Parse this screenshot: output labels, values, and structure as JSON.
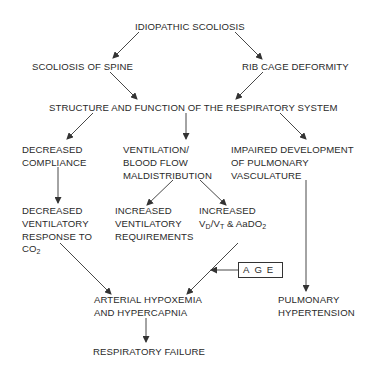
{
  "diagram": {
    "nodes": {
      "idiopathic": {
        "lines": [
          "IDIOPATHIC SCOLIOSIS"
        ]
      },
      "spine": {
        "lines": [
          "SCOLIOSIS OF SPINE"
        ]
      },
      "ribcage": {
        "lines": [
          "RIB CAGE DEFORMITY"
        ]
      },
      "structure": {
        "lines": [
          "STRUCTURE AND FUNCTION OF THE RESPIRATORY SYSTEM"
        ]
      },
      "compliance": {
        "lines": [
          "DECREASED",
          "COMPLIANCE"
        ]
      },
      "maldistribution": {
        "lines": [
          "VENTILATION/",
          "BLOOD FLOW",
          "MALDISTRIBUTION"
        ]
      },
      "vasculature": {
        "lines": [
          "IMPAIRED DEVELOPMENT",
          "OF PULMONARY",
          "VASCULATURE"
        ]
      },
      "vent_response": {
        "lines": [
          "DECREASED",
          "VENTILATORY",
          "RESPONSE TO",
          "CO",
          "2"
        ]
      },
      "vent_requirements": {
        "lines": [
          "INCREASED",
          "VENTILATORY",
          "REQUIREMENTS"
        ]
      },
      "vd_vt": {
        "lines": [
          "INCREASED",
          "V",
          "D",
          "/V",
          "T",
          " & AaDO",
          "2"
        ]
      },
      "age": {
        "label": "AGE"
      },
      "hypoxemia": {
        "lines": [
          "ARTERIAL HYPOXEMIA",
          "AND HYPERCAPNIA"
        ]
      },
      "pulm_htn": {
        "lines": [
          "PULMONARY",
          "HYPERTENSION"
        ]
      },
      "resp_failure": {
        "lines": [
          "RESPIRATORY FAILURE"
        ]
      }
    },
    "edges": [
      {
        "from": "IDIOPATHIC SCOLIOSIS",
        "to": "SCOLIOSIS OF SPINE"
      },
      {
        "from": "IDIOPATHIC SCOLIOSIS",
        "to": "RIB CAGE DEFORMITY"
      },
      {
        "from": "SCOLIOSIS OF SPINE",
        "to": "STRUCTURE AND FUNCTION OF THE RESPIRATORY SYSTEM"
      },
      {
        "from": "RIB CAGE DEFORMITY",
        "to": "STRUCTURE AND FUNCTION OF THE RESPIRATORY SYSTEM"
      },
      {
        "from": "STRUCTURE AND FUNCTION OF THE RESPIRATORY SYSTEM",
        "to": "DECREASED COMPLIANCE"
      },
      {
        "from": "STRUCTURE AND FUNCTION OF THE RESPIRATORY SYSTEM",
        "to": "VENTILATION/BLOOD FLOW MALDISTRIBUTION"
      },
      {
        "from": "STRUCTURE AND FUNCTION OF THE RESPIRATORY SYSTEM",
        "to": "IMPAIRED DEVELOPMENT OF PULMONARY VASCULATURE"
      },
      {
        "from": "DECREASED COMPLIANCE",
        "to": "DECREASED VENTILATORY RESPONSE TO CO2"
      },
      {
        "from": "VENTILATION/BLOOD FLOW MALDISTRIBUTION",
        "to": "INCREASED VENTILATORY REQUIREMENTS"
      },
      {
        "from": "VENTILATION/BLOOD FLOW MALDISTRIBUTION",
        "to": "INCREASED VD/VT & AaDO2"
      },
      {
        "from": "DECREASED VENTILATORY RESPONSE TO CO2",
        "to": "ARTERIAL HYPOXEMIA AND HYPERCAPNIA"
      },
      {
        "from": "INCREASED VD/VT & AaDO2",
        "to": "ARTERIAL HYPOXEMIA AND HYPERCAPNIA"
      },
      {
        "from": "AGE",
        "to": "INCREASED VD/VT & AaDO2 → ARTERIAL HYPOXEMIA edge"
      },
      {
        "from": "IMPAIRED DEVELOPMENT OF PULMONARY VASCULATURE",
        "to": "PULMONARY HYPERTENSION"
      },
      {
        "from": "ARTERIAL HYPOXEMIA AND HYPERCAPNIA",
        "to": "RESPIRATORY FAILURE"
      }
    ],
    "colors": {
      "line": "#333333",
      "text": "#2a2a2a",
      "background": "#ffffff"
    }
  }
}
